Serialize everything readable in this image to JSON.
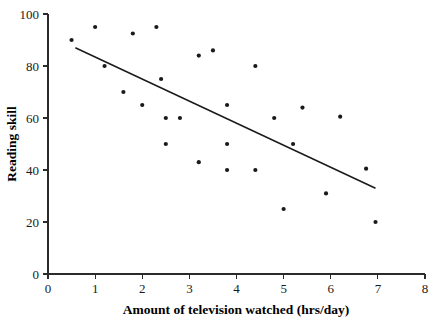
{
  "chart_data": {
    "type": "scatter",
    "title": "",
    "xlabel": "Amount of television watched (hrs/day)",
    "ylabel": "Reading skill",
    "xlim": [
      0,
      8
    ],
    "ylim": [
      0,
      100
    ],
    "xticks": [
      0,
      1,
      2,
      3,
      4,
      5,
      6,
      7,
      8
    ],
    "yticks": [
      0,
      20,
      40,
      60,
      80,
      100
    ],
    "xtick_labels": [
      "0",
      "1",
      "2",
      "3",
      "4",
      "5",
      "6",
      "7",
      "8"
    ],
    "ytick_labels": [
      "0",
      "20",
      "40",
      "60",
      "80",
      "100"
    ],
    "grid": false,
    "legend": false,
    "marker": "filled-circle",
    "marker_color": "#1a1a1a",
    "point_count": 27,
    "points": [
      {
        "x": 0.5,
        "y": 90
      },
      {
        "x": 1.0,
        "y": 95
      },
      {
        "x": 1.2,
        "y": 80
      },
      {
        "x": 1.6,
        "y": 70
      },
      {
        "x": 1.8,
        "y": 92.5
      },
      {
        "x": 2.0,
        "y": 65
      },
      {
        "x": 2.3,
        "y": 95
      },
      {
        "x": 2.4,
        "y": 75
      },
      {
        "x": 2.5,
        "y": 60
      },
      {
        "x": 2.5,
        "y": 50
      },
      {
        "x": 2.8,
        "y": 60
      },
      {
        "x": 3.2,
        "y": 84
      },
      {
        "x": 3.2,
        "y": 43
      },
      {
        "x": 3.5,
        "y": 86
      },
      {
        "x": 3.8,
        "y": 65
      },
      {
        "x": 3.8,
        "y": 50
      },
      {
        "x": 3.8,
        "y": 40
      },
      {
        "x": 4.4,
        "y": 80
      },
      {
        "x": 4.4,
        "y": 40
      },
      {
        "x": 4.8,
        "y": 60
      },
      {
        "x": 5.0,
        "y": 25
      },
      {
        "x": 5.2,
        "y": 50
      },
      {
        "x": 5.4,
        "y": 64
      },
      {
        "x": 5.9,
        "y": 31
      },
      {
        "x": 6.2,
        "y": 60.5
      },
      {
        "x": 6.75,
        "y": 40.5
      },
      {
        "x": 6.95,
        "y": 20
      }
    ],
    "series": [
      {
        "name": "Reading skill vs television",
        "x": [
          0.5,
          1.0,
          1.2,
          1.6,
          1.8,
          2.0,
          2.3,
          2.4,
          2.5,
          2.5,
          2.8,
          3.2,
          3.2,
          3.5,
          3.8,
          3.8,
          3.8,
          4.4,
          4.4,
          4.8,
          5.0,
          5.2,
          5.4,
          5.9,
          6.2,
          6.75,
          6.95
        ],
        "values": [
          90,
          95,
          80,
          70,
          92.5,
          65,
          95,
          75,
          60,
          50,
          60,
          84,
          43,
          86,
          65,
          50,
          40,
          80,
          40,
          60,
          25,
          50,
          64,
          31,
          60.5,
          40.5,
          20
        ]
      }
    ],
    "trend_line": {
      "type": "linear-fit",
      "x_start": 0.58,
      "y_start": 87.0,
      "x_end": 6.95,
      "y_end": 33.0,
      "color": "#1a1a1a"
    }
  },
  "colors": {
    "background": "#ffffff",
    "axis": "#2b2b2b",
    "marker": "#1a1a1a",
    "trend": "#1a1a1a",
    "text": "#000000"
  }
}
